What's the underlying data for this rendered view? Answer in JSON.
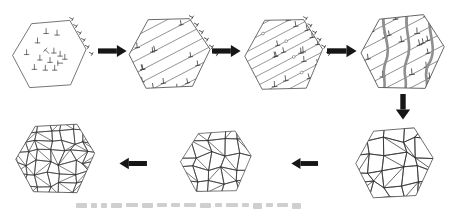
{
  "figure": {
    "background_color": "#ffffff",
    "caption": {
      "cropped": true,
      "text": ""
    }
  },
  "diagram": {
    "colors": {
      "hexagon_outline": "#4f4f4f",
      "slip_line": "#4a4a4a",
      "dislocation": "#3a3a3a",
      "grain_boundary": "#2e2e2e",
      "shear_band": "#8f8f8f",
      "nucleus_fill": "#ffffff",
      "arrow": "#161616",
      "caption_smudge": "#cfcfcf"
    },
    "glyphs": {
      "dislocation_symbol": "⊥"
    },
    "stages": [
      {
        "name": "hexagon-scattered-dislocations",
        "dislocation_count": 14,
        "dashed_wall": true
      },
      {
        "name": "hexagon-dislocation-walls-forming",
        "slip_line_count": 8,
        "dashed_wall": true
      },
      {
        "name": "hexagon-dense-dislocation-walls",
        "slip_line_count": 10,
        "dashed_wall": true,
        "nuclei_count": 4
      },
      {
        "name": "hexagon-shear-bands",
        "slip_line_count": 8,
        "shear_band_count": 3
      },
      {
        "name": "hexagon-new-grains-coarse",
        "grain_rows": 5
      },
      {
        "name": "hexagon-new-grains-medium",
        "grain_rows": 5
      },
      {
        "name": "hexagon-refined-grains-fine",
        "grain_rows": 7
      }
    ],
    "arrows": [
      {
        "name": "arrow-1-right",
        "direction": "right"
      },
      {
        "name": "arrow-2-right",
        "direction": "right"
      },
      {
        "name": "arrow-3-right",
        "direction": "right"
      },
      {
        "name": "arrow-4-down",
        "direction": "down"
      },
      {
        "name": "arrow-5-left",
        "direction": "left"
      },
      {
        "name": "arrow-6-left",
        "direction": "left"
      }
    ]
  }
}
